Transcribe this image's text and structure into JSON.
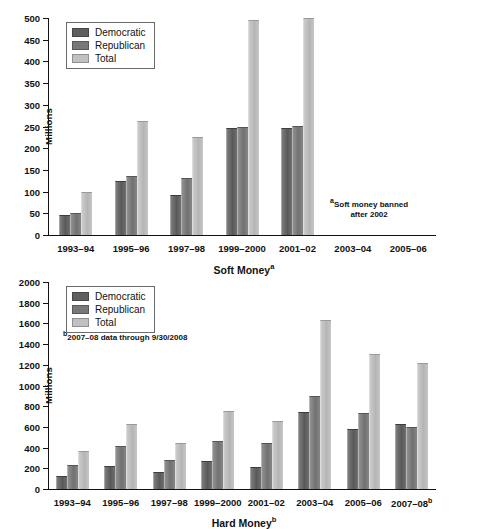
{
  "charts": [
    {
      "id": "soft-money",
      "ylabel": "Millions",
      "xlabel": "Soft Money",
      "xlabel_sup": "a",
      "footnote_sup": "a",
      "footnote_line1": "Soft money banned",
      "footnote_line2": "after 2002",
      "legend": [
        {
          "key": "dem",
          "label": "Democratic",
          "color": "#5f5f5f"
        },
        {
          "key": "rep",
          "label": "Republican",
          "color": "#787878"
        },
        {
          "key": "tot",
          "label": "Total",
          "color": "#c0c0c0"
        }
      ],
      "yticks": [
        0,
        50,
        100,
        150,
        200,
        250,
        300,
        350,
        400,
        450,
        500
      ],
      "chart_data": {
        "type": "bar",
        "title": "Soft Money",
        "xlabel": "Soft Money",
        "ylabel": "Millions",
        "ylim": [
          0,
          500
        ],
        "grid": false,
        "legend_position": "top-left",
        "categories": [
          "1993–94",
          "1995–96",
          "1997–98",
          "1999–2000",
          "2001–02",
          "2003–04",
          "2005–06"
        ],
        "series": [
          {
            "name": "Democratic",
            "values": [
              47,
              124,
              93,
              247,
              246,
              null,
              null
            ]
          },
          {
            "name": "Republican",
            "values": [
              51,
              136,
              131,
              249,
              252,
              null,
              null
            ]
          },
          {
            "name": "Total",
            "values": [
              100,
              263,
              225,
              495,
              500,
              null,
              null
            ]
          }
        ]
      }
    },
    {
      "id": "hard-money",
      "ylabel": "Millions",
      "xlabel": "Hard Money",
      "xlabel_sup": "b",
      "footnote_sup": "b",
      "footnote_line1": "2007–08 data through 9/30/2008",
      "footnote_line2": "",
      "legend": [
        {
          "key": "dem",
          "label": "Democratic",
          "color": "#5f5f5f"
        },
        {
          "key": "rep",
          "label": "Republican",
          "color": "#787878"
        },
        {
          "key": "tot",
          "label": "Total",
          "color": "#c0c0c0"
        }
      ],
      "yticks": [
        0,
        200,
        400,
        600,
        800,
        1000,
        1200,
        1400,
        1600,
        1800,
        2000
      ],
      "chart_data": {
        "type": "bar",
        "title": "Hard Money",
        "xlabel": "Hard Money",
        "ylabel": "Millions",
        "ylim": [
          0,
          2000
        ],
        "grid": false,
        "legend_position": "top-left",
        "categories": [
          "1993–94",
          "1995–96",
          "1997–98",
          "1999–2000",
          "2001–02",
          "2003–04",
          "2005–06",
          "2007–08"
        ],
        "category_sups": [
          "",
          "",
          "",
          "",
          "",
          "",
          "",
          "b"
        ],
        "series": [
          {
            "name": "Democratic",
            "values": [
              128,
              218,
              160,
              275,
              217,
              740,
              580,
              633
            ]
          },
          {
            "name": "Republican",
            "values": [
              235,
              414,
              285,
              465,
              447,
              900,
              730,
              597
            ]
          },
          {
            "name": "Total",
            "values": [
              370,
              630,
              443,
              757,
              653,
              1630,
              1305,
              1218
            ]
          }
        ]
      }
    }
  ]
}
